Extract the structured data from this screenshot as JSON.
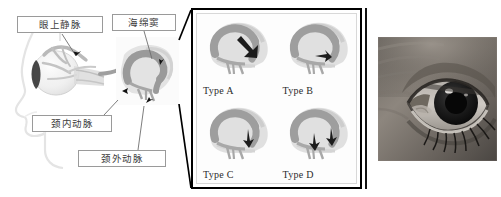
{
  "figure": {
    "background_color": "#ffffff",
    "width": 501,
    "height": 197,
    "kind": "medical-anatomy-figure"
  },
  "left_panel": {
    "name": "carotid-cavernous-fistula-anatomy",
    "description_visible": false,
    "labels": [
      {
        "id": "superior-ophthalmic-vein",
        "text": "眼上静脉",
        "box": {
          "x": 17,
          "y": 16,
          "w": 86,
          "h": 17
        }
      },
      {
        "id": "cavernous-sinus",
        "text": "海绵窦",
        "box": {
          "x": 112,
          "y": 14,
          "w": 64,
          "h": 17
        }
      },
      {
        "id": "internal-carotid-artery",
        "text": "颈内动脉",
        "box": {
          "x": 32,
          "y": 115,
          "w": 80,
          "h": 17
        }
      },
      {
        "id": "external-carotid-artery",
        "text": "颈外动脉",
        "box": {
          "x": 78,
          "y": 150,
          "w": 88,
          "h": 17
        }
      }
    ],
    "inset_box": {
      "x": 116,
      "y": 37,
      "w": 63,
      "h": 68,
      "border_color": "#000000"
    },
    "colors": {
      "artery": "#9a9a9a",
      "vein": "#b9b9b9",
      "globe": "#efefef",
      "iris": "#3a3a3a",
      "face_outline": "#e2e2e2",
      "label_border": "#9a9a9a",
      "leader_line": "#6e6e6e"
    }
  },
  "middle_panel": {
    "name": "barrow-classification-types",
    "border_color": "#000000",
    "types": [
      {
        "id": "type-a",
        "label": "Type A",
        "arrow_count": 1,
        "arrow_style": "large-solid",
        "arrow_angle_deg": 55
      },
      {
        "id": "type-b",
        "label": "Type B",
        "arrow_count": 1,
        "arrow_style": "small-solid",
        "arrow_angle_deg": 20
      },
      {
        "id": "type-c",
        "label": "Type C",
        "arrow_count": 1,
        "arrow_style": "small-solid",
        "arrow_angle_deg": 75
      },
      {
        "id": "type-d",
        "label": "Type D",
        "arrow_count": 2,
        "arrow_style": "small-solid",
        "arrow_angle_deg": 70
      }
    ],
    "colors": {
      "vessel": "#9e9e9e",
      "vessel_dark": "#8a8a8a",
      "bone": "#dcdcdc",
      "bone_shadow": "#c6c6c6",
      "arrow": "#1a1a1a",
      "background": "#fdfdfd"
    }
  },
  "right_panel": {
    "name": "clinical-eye-photograph",
    "media_type": "grayscale-photograph",
    "subject": "eye with proptosis and conjunctival chemosis",
    "frame": {
      "x": 378,
      "y": 37,
      "w": 119,
      "h": 124
    },
    "divider_rule": {
      "x": 365,
      "y": 8,
      "h": 181,
      "color": "#111111"
    },
    "colors": {
      "skin_light": "#b0a9a3",
      "skin_mid": "#7f7870",
      "skin_dark": "#4e4a46",
      "sclera": "#d8d4cf",
      "iris": "#1b1b1b",
      "pupil": "#080808",
      "highlight": "#f2f0ee"
    }
  }
}
